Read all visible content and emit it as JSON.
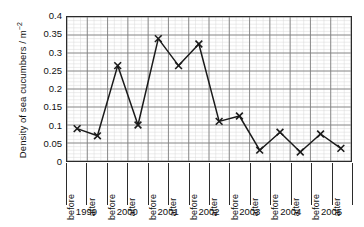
{
  "chart_data": {
    "type": "line",
    "title": "",
    "xlabel": "",
    "ylabel": "Density of sea cucumbers / m",
    "ylabel_exponent": "−2",
    "ylim": [
      0,
      0.4
    ],
    "ytick_step": 0.05,
    "yticks": [
      "0.4",
      "0.35",
      "0.3",
      "0.25",
      "0.2",
      "0.15",
      "0.1",
      "0.05",
      "0"
    ],
    "ytick_values": [
      0.4,
      0.35,
      0.3,
      0.25,
      0.2,
      0.15,
      0.1,
      0.05,
      0
    ],
    "grid": true,
    "minor_grid": true,
    "legend": "none",
    "marker": "cross",
    "line_color": "#1a1a1a",
    "grid_color": "#808080",
    "minor_grid_color": "#d8d8d8",
    "frame_color": "#2b2b2b",
    "categories": [
      "before",
      "after",
      "before",
      "after",
      "before",
      "after",
      "before",
      "after",
      "before",
      "after",
      "before",
      "after",
      "before",
      "after"
    ],
    "groups": [
      "1999",
      "2000",
      "2001",
      "2002",
      "2003",
      "2004",
      "2005"
    ],
    "values": [
      0.09,
      0.07,
      0.265,
      0.1,
      0.34,
      0.265,
      0.325,
      0.11,
      0.125,
      0.03,
      0.08,
      0.025,
      0.075,
      0.035
    ],
    "points": [
      {
        "group": "1999",
        "phase": "before",
        "value": 0.09
      },
      {
        "group": "1999",
        "phase": "after",
        "value": 0.07
      },
      {
        "group": "2000",
        "phase": "before",
        "value": 0.265
      },
      {
        "group": "2000",
        "phase": "after",
        "value": 0.1
      },
      {
        "group": "2001",
        "phase": "before",
        "value": 0.34
      },
      {
        "group": "2001",
        "phase": "after",
        "value": 0.265
      },
      {
        "group": "2002",
        "phase": "before",
        "value": 0.325
      },
      {
        "group": "2002",
        "phase": "after",
        "value": 0.11
      },
      {
        "group": "2003",
        "phase": "before",
        "value": 0.125
      },
      {
        "group": "2003",
        "phase": "after",
        "value": 0.03
      },
      {
        "group": "2004",
        "phase": "before",
        "value": 0.08
      },
      {
        "group": "2004",
        "phase": "after",
        "value": 0.025
      },
      {
        "group": "2005",
        "phase": "before",
        "value": 0.075
      },
      {
        "group": "2005",
        "phase": "after",
        "value": 0.035
      }
    ]
  }
}
